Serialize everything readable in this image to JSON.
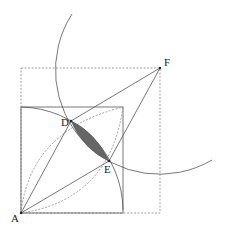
{
  "diagram": {
    "type": "geometric-construction",
    "colors": {
      "stroke": "#555555",
      "dashed": "#888888",
      "shade": "#666666",
      "label": "#222222"
    },
    "points": [
      {
        "name": "A",
        "x": 21,
        "y": 213,
        "label": "A",
        "lx": 11,
        "ly": 222
      },
      {
        "name": "D",
        "x": 71,
        "y": 121,
        "label": "D",
        "lx": 61,
        "ly": 126
      },
      {
        "name": "E",
        "x": 109,
        "y": 161,
        "label": "E",
        "lx": 104,
        "ly": 173
      },
      {
        "name": "F",
        "x": 160,
        "y": 68,
        "label": "F",
        "lx": 164,
        "ly": 66
      }
    ],
    "solid_square": {
      "x": 21,
      "y": 107,
      "size": 102
    },
    "dashed_square": {
      "x": 21,
      "y": 68,
      "w": 139,
      "h": 145
    },
    "arcs": [
      {
        "center": "A",
        "radius": 102,
        "style": "solid"
      },
      {
        "center": "F",
        "radius": 104,
        "style": "solid"
      },
      {
        "from": "A",
        "to": "top-right-corner",
        "via": "D",
        "style": "dashed"
      },
      {
        "from": "A",
        "to": "top-right-corner",
        "via": "E",
        "style": "dashed"
      }
    ],
    "segments": [
      "A-D",
      "A-E",
      "D-F",
      "E-F"
    ],
    "shaded_region": "lens between D and E"
  }
}
